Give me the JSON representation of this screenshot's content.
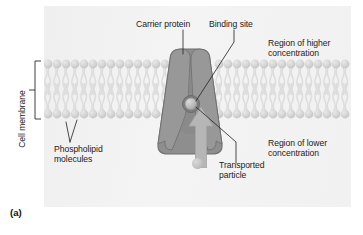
{
  "figure": {
    "letter": "(a)",
    "caption_labels": {
      "carrier_protein": "Carrier protein",
      "binding_site": "Binding site",
      "region_higher": "Region of higher\nconcentration",
      "region_lower": "Region of lower\nconcentration",
      "phospholipid": "Phospholipid\nmolecules",
      "transported_particle": "Transported\nparticle",
      "cell_membrane": "Cell membrane"
    }
  },
  "diagram": {
    "type": "facilitated-diffusion-carrier-protein",
    "structures": [
      {
        "name": "cell-membrane",
        "description": "phospholipid bilayer"
      },
      {
        "name": "carrier-protein",
        "description": "transmembrane trapezoidal protein with two lobes"
      },
      {
        "name": "binding-site",
        "description": "socket holding transported particle"
      },
      {
        "name": "transported-particle",
        "description": "small sphere moving through carrier"
      },
      {
        "name": "transport-arrow",
        "description": "upward arrow showing direction of transport"
      }
    ],
    "gradient": {
      "top": "Region of higher concentration",
      "bottom": "Region of lower concentration"
    }
  },
  "colors": {
    "panel_background": "#f3f3f3",
    "protein_body": "#8e8e8e",
    "protein_lobe": "#9a9a9a",
    "protein_outline": "#6f6f6f",
    "arrow": "#b6b6b6",
    "membrane_head": "#d5d5d5",
    "membrane_tail": "#e6e6e6",
    "particle": "#c2c2c2",
    "text": "#1b1b1b",
    "leader_line": "#2a2a2a"
  }
}
